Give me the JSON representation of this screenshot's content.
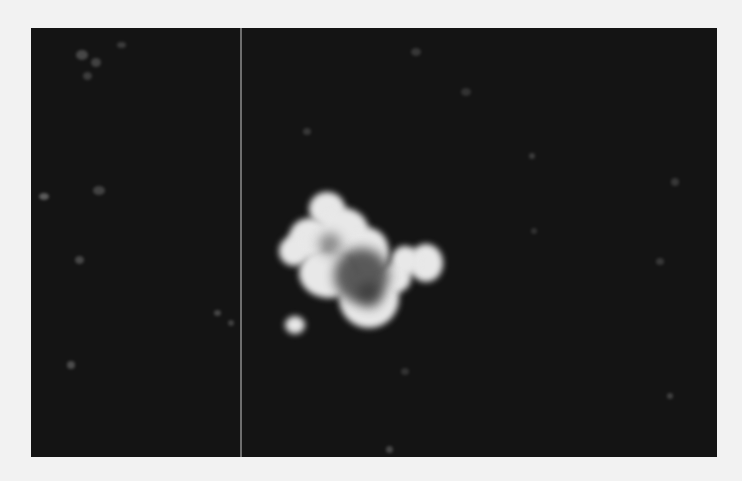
{
  "image": {
    "description": "Dark-field fluorescence microscopy image with a bright irregular cell cluster in the center, a small bright satellite blob below-left, and faint scattered specks on a dark background, with a thin vertical line artifact on the left",
    "background_color": "#141414",
    "frame_color": "#f2f2f2",
    "line_color": "#6e6e6e",
    "cluster_color": "#e8e8e8"
  }
}
